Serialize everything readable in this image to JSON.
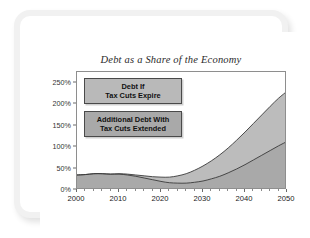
{
  "chart_data": {
    "type": "area",
    "title": "Debt as a Share of the Economy",
    "xlabel": "",
    "ylabel": "",
    "stacked": true,
    "grid": false,
    "legend_position": "inside-top-left",
    "xlim": [
      2000,
      2050
    ],
    "ylim": [
      0,
      275
    ],
    "xticks": [
      2000,
      2010,
      2020,
      2030,
      2040,
      2050
    ],
    "xtick_labels": [
      "2000",
      "2010",
      "2020",
      "2030",
      "2040",
      "2050"
    ],
    "x_minor_tick_interval": 2,
    "yticks": [
      0,
      50,
      100,
      150,
      200,
      250
    ],
    "ytick_labels": [
      "0%",
      "50%",
      "100%",
      "150%",
      "200%",
      "250%"
    ],
    "x": [
      2000,
      2002,
      2004,
      2006,
      2008,
      2010,
      2012,
      2014,
      2016,
      2018,
      2020,
      2022,
      2024,
      2026,
      2028,
      2030,
      2032,
      2034,
      2036,
      2038,
      2040,
      2042,
      2044,
      2046,
      2048,
      2050
    ],
    "series": [
      {
        "name": "Debt If Tax Cuts Expire",
        "color": "#a9a9a9",
        "values": [
          35,
          36,
          38,
          38,
          37,
          37,
          35,
          32,
          28,
          24,
          20,
          17,
          16,
          16,
          18,
          21,
          26,
          32,
          40,
          49,
          59,
          70,
          81,
          92,
          103,
          113
        ]
      },
      {
        "name": "Additional Debt With Tax Cuts Extended",
        "color": "#bcbcbc",
        "values": [
          0,
          0,
          0,
          0,
          0,
          1,
          2,
          3,
          5,
          7,
          10,
          13,
          17,
          22,
          28,
          35,
          42,
          50,
          58,
          67,
          76,
          85,
          94,
          103,
          111,
          117
        ]
      }
    ],
    "total_top_values": [
      35,
      36,
      38,
      38,
      37,
      38,
      37,
      35,
      33,
      31,
      30,
      30,
      33,
      38,
      46,
      56,
      68,
      82,
      98,
      116,
      135,
      155,
      175,
      195,
      214,
      230
    ],
    "annotations": []
  },
  "legend": {
    "upper": {
      "line1": "Debt If",
      "line2": "Tax Cuts Expire"
    },
    "lower": {
      "line1": "Additional Debt With",
      "line2": "Tax Cuts Extended"
    }
  }
}
